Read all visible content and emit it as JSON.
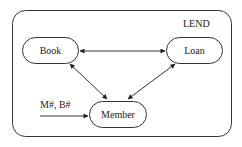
{
  "diagram": {
    "container": {
      "label": "LEND"
    },
    "nodes": [
      {
        "id": "book",
        "label": "Book"
      },
      {
        "id": "loan",
        "label": "Loan"
      },
      {
        "id": "member",
        "label": "Member"
      }
    ],
    "edges": [
      {
        "from": "book",
        "to": "loan",
        "type": "bidirectional"
      },
      {
        "from": "book",
        "to": "member",
        "type": "bidirectional"
      },
      {
        "from": "loan",
        "to": "member",
        "type": "bidirectional"
      }
    ],
    "input": {
      "label": "M#, B#",
      "to": "member"
    }
  },
  "colors": {
    "stroke": "#333333",
    "fill": "#ffffff",
    "text": "#222222"
  }
}
